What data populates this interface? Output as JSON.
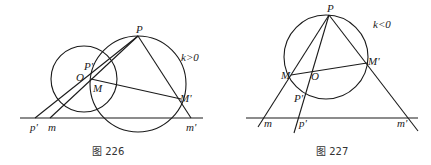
{
  "figures": [
    {
      "caption": "图 226",
      "condition": "k>0",
      "labels": {
        "P": "P",
        "P_prime": "P'",
        "O": "O",
        "M": "M",
        "M_prime": "M'",
        "p_prime": "p'",
        "m": "m",
        "m_prime": "m'"
      },
      "elements": {
        "circles": [
          {
            "name": "small-circle",
            "cx": 84,
            "cy": 79,
            "r": 33
          },
          {
            "name": "large-circle",
            "cx": 138,
            "cy": 84,
            "r": 48
          }
        ],
        "baseline": {
          "x1": 20,
          "y1": 118,
          "x2": 203,
          "y2": 118
        },
        "points": {
          "P": [
            138,
            36
          ],
          "O": [
            84,
            78
          ],
          "P_prime": [
            90,
            69
          ],
          "M": [
            92,
            80
          ],
          "M_prime": [
            181,
            99
          ],
          "p_prime": [
            35,
            118
          ],
          "m": [
            50,
            118
          ],
          "m_prime": [
            191,
            118
          ]
        }
      }
    },
    {
      "caption": "图 227",
      "condition": "k<0",
      "labels": {
        "P": "P",
        "P_prime": "P'",
        "O": "O",
        "M": "M",
        "M_prime": "M'",
        "p_prime": "p'",
        "m": "m",
        "m_prime": "m'"
      },
      "elements": {
        "circles": [
          {
            "name": "circle",
            "cx": 326,
            "cy": 57,
            "r": 42
          }
        ],
        "baseline": {
          "x1": 246,
          "y1": 118,
          "x2": 418,
          "y2": 118
        },
        "points": {
          "P": [
            329,
            15
          ],
          "O": [
            313,
            72
          ],
          "P_prime": [
            306,
            96
          ],
          "M": [
            291,
            75
          ],
          "M_prime": [
            367,
            63
          ],
          "p_prime": [
            297,
            118
          ],
          "m": [
            263,
            118
          ],
          "m_prime": [
            410,
            118
          ]
        }
      }
    }
  ]
}
